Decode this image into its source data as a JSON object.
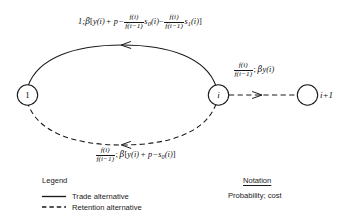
{
  "figure": {
    "nodes": [
      {
        "id": "start",
        "label": "1",
        "italic": false
      },
      {
        "id": "current",
        "label": "i",
        "italic": true
      },
      {
        "id": "next",
        "label": "i+1",
        "italic": true,
        "label_outside": true
      }
    ],
    "edges": [
      {
        "id": "trade-return-edge",
        "style": "solid",
        "direction": "i-to-1",
        "legend_class": "Trade alternative",
        "label_plain": "1; β[y(i) + p − f(i)/f(i−1) s₀(i) − f(i)/f(i−1) s₁(i)]",
        "probability": "1",
        "cost_parts": {
          "lead": "1;",
          "greek": "β",
          "open": "[",
          "y_term": "y(i)",
          "plus_p": "+ p",
          "minus1": "−",
          "frac1_num": "f(i)",
          "frac1_den": "f(i−1)",
          "s0": "s",
          "s0_sub": "0",
          "s0_arg": "(i)",
          "minus2": "−",
          "frac2_num": "f(i)",
          "frac2_den": "f(i−1)",
          "s1": "s",
          "s1_sub": "1",
          "s1_arg": "(i)",
          "close": "]"
        }
      },
      {
        "id": "retention-return-edge",
        "style": "dashed",
        "direction": "i-to-1",
        "legend_class": "Retention alternative",
        "label_plain": "f(i)/f(i−1); β[y(i) + p − s₀(i)]",
        "cost_parts": {
          "frac_num": "f(i)",
          "frac_den": "f(i−1)",
          "semicolon": ";",
          "greek": "β",
          "open": "[",
          "y_term": "y(i)",
          "plus_p": "+ p",
          "minus": "−",
          "s0": "s",
          "s0_sub": "0",
          "s0_arg": "(i)",
          "close": "]"
        }
      },
      {
        "id": "retention-advance-edge",
        "style": "dashed",
        "direction": "i-to-i+1",
        "legend_class": "Retention alternative",
        "label_plain": "f(i)/f(i−1); βy(i)",
        "cost_parts": {
          "frac_num": "f(i)",
          "frac_den": "f(i−1)",
          "semicolon": ";",
          "greek": "β",
          "y_term": "y(i)"
        }
      }
    ]
  },
  "legend": {
    "title": "Legend",
    "items": [
      {
        "sample": "solid-line",
        "label": "Trade alternative"
      },
      {
        "sample": "dashed-line",
        "label": "Retention alternative"
      }
    ]
  },
  "notation": {
    "title": "Notation",
    "body": "Probability; cost"
  },
  "colors": {
    "ink": "#0d0d0d",
    "line": "#1a1a1a",
    "background": "#ffffff"
  }
}
